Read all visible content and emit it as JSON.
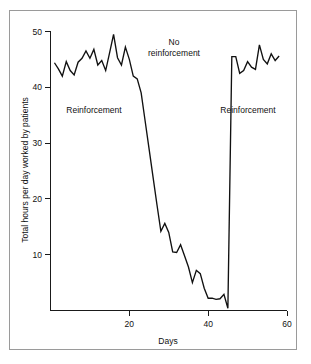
{
  "figure": {
    "background_color": "#ffffff",
    "frame_color": "#9a9a9a",
    "line_color": "#111111"
  },
  "chart_data": {
    "type": "line",
    "title": "",
    "subtitle": "",
    "xlabel": "Days",
    "ylabel": "Total hours per day worked by patients",
    "xlim": [
      0,
      60
    ],
    "ylim": [
      0,
      50
    ],
    "xticks": [
      20,
      40,
      60
    ],
    "xtick_labels": [
      "20",
      "40",
      "60"
    ],
    "yticks": [
      10,
      20,
      30,
      40,
      50
    ],
    "ytick_labels": [
      "10",
      "20",
      "30",
      "40",
      "50"
    ],
    "grid": false,
    "legend": "none",
    "annotations": [
      {
        "name": "phase-label-reinforcement-1",
        "text": "Reinforcement",
        "x": 10.0,
        "y": 33.0,
        "lines": [
          "Reinforcement"
        ]
      },
      {
        "name": "phase-label-no-reinforcement",
        "text": "No reinforcement",
        "x": 30.0,
        "y": 46.5,
        "lines": [
          "No",
          "reinforcement"
        ]
      },
      {
        "name": "phase-label-reinforcement-2",
        "text": "Reinforcement",
        "x": 50.0,
        "y": 33.0,
        "lines": [
          "Reinforcement"
        ]
      }
    ],
    "phases": [
      {
        "name": "Reinforcement",
        "x_start": 1,
        "x_end": 20
      },
      {
        "name": "No reinforcement",
        "x_start": 20,
        "x_end": 40
      },
      {
        "name": "Reinforcement",
        "x_start": 40,
        "x_end": 58
      }
    ],
    "series": [
      {
        "name": "Total hours per day worked by patients",
        "color": "#111111",
        "x": [
          1,
          2,
          3,
          4,
          5,
          6,
          7,
          8,
          9,
          10,
          11,
          12,
          13,
          14,
          15,
          16,
          17,
          18,
          19,
          20,
          20,
          21,
          22,
          23,
          24,
          25,
          26,
          27,
          28,
          29,
          30,
          31,
          32,
          33,
          34,
          35,
          36,
          37,
          38,
          39,
          40,
          40,
          41,
          42,
          43,
          44,
          45,
          46,
          47,
          48,
          49,
          50,
          51,
          52,
          53,
          54,
          55,
          56,
          57,
          58
        ],
        "values": [
          44.4,
          43.3,
          42.0,
          44.6,
          43.0,
          42.2,
          44.5,
          45.2,
          46.5,
          45.2,
          46.8,
          44.0,
          44.8,
          43.0,
          46.2,
          49.5,
          45.3,
          44.0,
          47.2,
          45.0,
          45.0,
          42.0,
          41.5,
          39.0,
          34.0,
          29.0,
          24.0,
          19.0,
          14.2,
          15.6,
          14.0,
          10.5,
          10.4,
          11.8,
          9.8,
          7.8,
          5.0,
          7.2,
          6.6,
          4.0,
          2.2,
          2.2,
          2.2,
          2.0,
          2.1,
          2.9,
          0.4,
          45.5,
          45.5,
          42.5,
          43.0,
          44.6,
          43.6,
          43.2,
          47.6,
          45.0,
          44.2,
          46.0,
          44.8,
          45.6
        ]
      }
    ]
  }
}
